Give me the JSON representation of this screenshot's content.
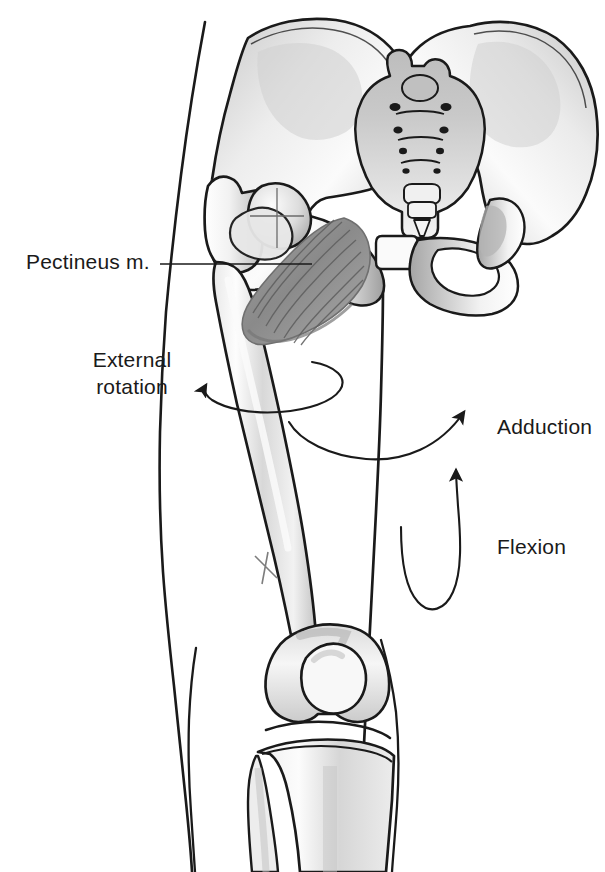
{
  "figure": {
    "background_color": "#ffffff",
    "ink_color": "#1a1a1a",
    "muscle_color": "#8c8c8c",
    "bone_shade_color": "#b8b8b8",
    "width": 605,
    "height": 872
  },
  "labels": {
    "pectineus": "Pectineus m.",
    "external_rotation_line1": "External",
    "external_rotation_line2": "rotation",
    "adduction": "Adduction",
    "flexion": "Flexion"
  },
  "anatomy_parts": [
    {
      "name": "left-ilium",
      "label": "Ilium (left)"
    },
    {
      "name": "right-ilium",
      "label": "Ilium (right)"
    },
    {
      "name": "sacrum",
      "label": "Sacrum"
    },
    {
      "name": "coccyx",
      "label": "Coccyx"
    },
    {
      "name": "pubic-symphysis",
      "label": "Pubic symphysis"
    },
    {
      "name": "obturator-foramen",
      "label": "Obturator foramen"
    },
    {
      "name": "femoral-head",
      "label": "Femoral head"
    },
    {
      "name": "greater-trochanter",
      "label": "Greater trochanter"
    },
    {
      "name": "femur-shaft",
      "label": "Femur shaft"
    },
    {
      "name": "femoral-condyles",
      "label": "Femoral condyles"
    },
    {
      "name": "patella",
      "label": "Patella"
    },
    {
      "name": "tibia",
      "label": "Tibia"
    },
    {
      "name": "fibula",
      "label": "Fibula"
    },
    {
      "name": "pectineus-muscle",
      "label": "Pectineus muscle"
    },
    {
      "name": "skin-outline-thigh",
      "label": "Thigh skin contour"
    },
    {
      "name": "skin-outline-medial",
      "label": "Medial thigh contour"
    }
  ],
  "motion_arrows": [
    {
      "name": "external-rotation-arrow",
      "action": "External rotation",
      "style": "ellipse-loop"
    },
    {
      "name": "adduction-arrow",
      "action": "Adduction",
      "style": "curved-sweep"
    },
    {
      "name": "flexion-arrow",
      "action": "Flexion",
      "style": "u-loop-upward"
    }
  ],
  "leader_lines": [
    {
      "name": "pectineus-leader",
      "from_label": "Pectineus m.",
      "to_part": "pectineus-muscle"
    }
  ]
}
